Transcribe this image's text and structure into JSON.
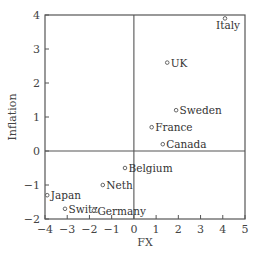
{
  "chart_data": {
    "type": "scatter",
    "title": "",
    "xlabel": "FX",
    "ylabel": "Inflation",
    "xlim": [
      -4,
      5
    ],
    "ylim": [
      -2,
      4
    ],
    "xticks": [
      -4,
      -3,
      -2,
      -1,
      0,
      1,
      2,
      3,
      4,
      5
    ],
    "yticks": [
      -2,
      -1,
      0,
      1,
      2,
      3,
      4
    ],
    "grid": false,
    "reference_lines": {
      "x": 0,
      "y": 0
    },
    "marker": "open-circle",
    "points": [
      {
        "label": "Italy",
        "x": 4.1,
        "y": 3.9,
        "label_pos": "below"
      },
      {
        "label": "UK",
        "x": 1.5,
        "y": 2.6,
        "label_pos": "right"
      },
      {
        "label": "Sweden",
        "x": 1.9,
        "y": 1.2,
        "label_pos": "right"
      },
      {
        "label": "France",
        "x": 0.8,
        "y": 0.7,
        "label_pos": "right"
      },
      {
        "label": "Canada",
        "x": 1.3,
        "y": 0.2,
        "label_pos": "right"
      },
      {
        "label": "Belgium",
        "x": -0.4,
        "y": -0.5,
        "label_pos": "right"
      },
      {
        "label": "Neth",
        "x": -1.4,
        "y": -1.0,
        "label_pos": "right"
      },
      {
        "label": "Japan",
        "x": -3.9,
        "y": -1.3,
        "label_pos": "right"
      },
      {
        "label": "Switz",
        "x": -3.1,
        "y": -1.7,
        "label_pos": "right"
      },
      {
        "label": "Germany",
        "x": -1.8,
        "y": -1.75,
        "label_pos": "right"
      }
    ]
  },
  "layout": {
    "plot": {
      "left": 45,
      "right": 245,
      "top": 15,
      "bottom": 219
    },
    "colors": {
      "axis": "#555555",
      "marker": "#555555",
      "text": "#333333"
    }
  }
}
